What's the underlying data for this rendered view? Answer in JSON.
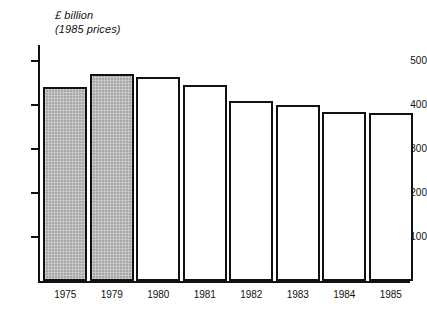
{
  "chart_data": {
    "type": "bar",
    "title": "£ billion",
    "subtitle": "(1985 prices)",
    "xlabel": "",
    "ylabel": "£ billion (1985 prices)",
    "categories": [
      "1975",
      "1979",
      "1980",
      "1981",
      "1982",
      "1983",
      "1984",
      "1985"
    ],
    "values": [
      442,
      470,
      464,
      445,
      410,
      400,
      385,
      381
    ],
    "series": [
      {
        "name": "£ billion (1985 prices)",
        "values": [
          442,
          470,
          464,
          445,
          410,
          400,
          385,
          381
        ]
      }
    ],
    "bar_styles": [
      "shaded",
      "shaded",
      "open",
      "open",
      "open",
      "open",
      "open",
      "open"
    ],
    "ylim": [
      0,
      500
    ],
    "yticks": [
      100,
      200,
      300,
      400,
      500
    ],
    "ytick_labels": [
      "100",
      "200",
      "300",
      "400",
      "500"
    ],
    "grid": false,
    "legend": false,
    "colors": {
      "shaded_fill": "#a8a8a8",
      "open_fill": "#ffffff",
      "outline": "#111111",
      "background": "#ffffff"
    }
  },
  "axis": {
    "title_line_1": "£ billion",
    "title_line_2": "(1985 prices)"
  }
}
